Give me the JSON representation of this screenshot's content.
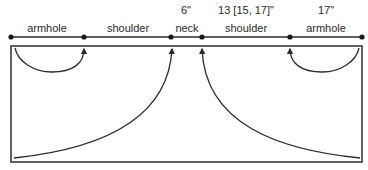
{
  "diagram": {
    "measurements": {
      "neck": "6\"",
      "shoulder_right": "13 [15, 17]\"",
      "armhole_right": "17\""
    },
    "segments": [
      {
        "label": "armhole"
      },
      {
        "label": "shoulder"
      },
      {
        "label": "neck"
      },
      {
        "label": "shoulder"
      },
      {
        "label": "armhole"
      }
    ],
    "colors": {
      "line": "#2a2a2a",
      "background": "#ffffff"
    }
  }
}
